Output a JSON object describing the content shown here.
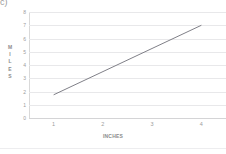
{
  "figure": {
    "part_label": "c)",
    "background_color": "#ffffff"
  },
  "chart_data": {
    "type": "line",
    "title": "",
    "subtitle": "",
    "xlabel": "INCHES",
    "ylabel": "MILES",
    "ylabel_letters": [
      "M",
      "I",
      "L",
      "E",
      "S"
    ],
    "x": [
      1,
      4
    ],
    "values": [
      1.75,
      7
    ],
    "series": [
      {
        "name": "distance",
        "x": [
          1,
          4
        ],
        "values": [
          1.75,
          7
        ],
        "color": "#808088"
      }
    ],
    "xticks": [
      1,
      2,
      3,
      4
    ],
    "xtick_labels": [
      "1",
      "2",
      "3",
      "4"
    ],
    "yticks": [
      0,
      1,
      2,
      3,
      4,
      5,
      6,
      7,
      8
    ],
    "ytick_labels": [
      "8",
      "7",
      "6",
      "5",
      "4",
      "3",
      "2",
      "1",
      "0"
    ],
    "xlim": [
      0.5,
      4.5
    ],
    "ylim": [
      0,
      8
    ],
    "grid": true,
    "grid_axis": "y",
    "grid_color": "#e8e8ea",
    "axis_color": "#d4d4d6",
    "legend": false,
    "legend_position": "none",
    "line_color": "#808088",
    "line_width": 1,
    "markers": false,
    "annotations": []
  }
}
